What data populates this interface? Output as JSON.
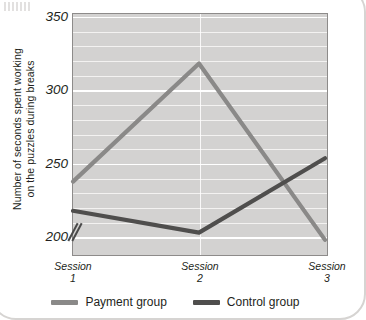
{
  "chart_data": {
    "type": "line",
    "title": "",
    "xlabel": "",
    "ylabel": "Number of seconds spent working on the puzzles during breaks",
    "ylabel_line1": "Number of seconds spent working",
    "ylabel_line2": "on the puzzles during breaks",
    "categories": [
      "Session 1",
      "Session 2",
      "Session 3"
    ],
    "category_lines": [
      {
        "word": "Session",
        "number": "1"
      },
      {
        "word": "Session",
        "number": "2"
      },
      {
        "word": "Session",
        "number": "3"
      }
    ],
    "ylim": [
      190,
      350
    ],
    "ytick_labels": [
      "350",
      "300",
      "250",
      "200"
    ],
    "ytick_values": [
      350,
      300,
      250,
      200
    ],
    "minor_gridline_step": 10,
    "axis_break": true,
    "grid": true,
    "legend_position": "bottom",
    "series": [
      {
        "name": "Payment group",
        "color": "#8a8988",
        "values": [
          237,
          318,
          197
        ]
      },
      {
        "name": "Control group",
        "color": "#4f4e4d",
        "values": [
          217,
          202,
          253
        ]
      }
    ],
    "plot_background": "#d3d2d1",
    "gridline_color": "#ffffff",
    "text_color": "#231f20"
  }
}
